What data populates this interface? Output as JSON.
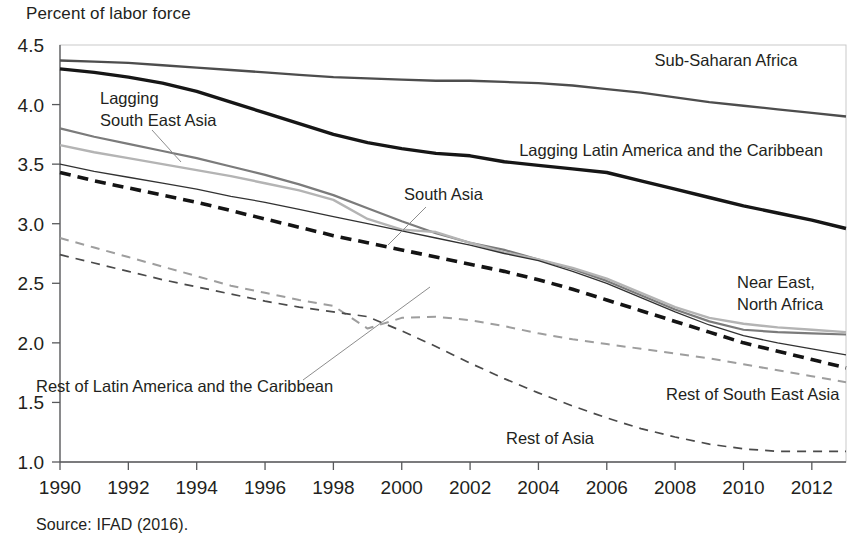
{
  "figure": {
    "y_axis_title": "Percent of labor force",
    "source_note": "Source: IFAD (2016)."
  },
  "chart_data": {
    "type": "line",
    "title": "",
    "subtitle": "",
    "xlabel": "",
    "ylabel": "Percent of labor force",
    "xlim": [
      1990,
      2013
    ],
    "ylim": [
      1.0,
      4.5
    ],
    "xticks": [
      1990,
      1992,
      1994,
      1996,
      1998,
      2000,
      2002,
      2004,
      2006,
      2008,
      2010,
      2012
    ],
    "yticks": [
      1.0,
      1.5,
      2.0,
      2.5,
      3.0,
      3.5,
      4.0,
      4.5
    ],
    "ytick_labels": [
      "1.0",
      "1.5",
      "2.0",
      "2.5",
      "3.0",
      "3.5",
      "4.0",
      "4.5"
    ],
    "xtick_labels": [
      "1990",
      "1992",
      "1994",
      "1996",
      "1998",
      "2000",
      "2002",
      "2004",
      "2006",
      "2008",
      "2010",
      "2012"
    ],
    "grid": false,
    "legend_position": "inline-annotations",
    "x": [
      1990,
      1991,
      1992,
      1993,
      1994,
      1995,
      1996,
      1997,
      1998,
      1999,
      2000,
      2001,
      2002,
      2003,
      2004,
      2005,
      2006,
      2007,
      2008,
      2009,
      2010,
      2011,
      2012,
      2013
    ],
    "series": [
      {
        "name": "Sub-Saharan Africa",
        "color": "#4d4d4d",
        "width": 2.3,
        "dash": "none",
        "values": [
          4.37,
          4.36,
          4.35,
          4.33,
          4.31,
          4.29,
          4.27,
          4.25,
          4.23,
          4.22,
          4.21,
          4.2,
          4.2,
          4.19,
          4.18,
          4.16,
          4.13,
          4.1,
          4.06,
          4.02,
          3.99,
          3.96,
          3.93,
          3.9
        ]
      },
      {
        "name": "Lagging Latin America and the Caribbean",
        "color": "#161616",
        "width": 3.4,
        "dash": "none",
        "values": [
          4.3,
          4.27,
          4.23,
          4.18,
          4.11,
          4.02,
          3.93,
          3.84,
          3.75,
          3.68,
          3.63,
          3.59,
          3.57,
          3.52,
          3.49,
          3.46,
          3.43,
          3.36,
          3.29,
          3.22,
          3.15,
          3.09,
          3.03,
          2.96
        ]
      },
      {
        "name": "Lagging South East Asia",
        "color": "#7b7b7b",
        "width": 2.2,
        "dash": "none",
        "values": [
          3.8,
          3.73,
          3.67,
          3.61,
          3.55,
          3.48,
          3.41,
          3.33,
          3.24,
          3.13,
          3.02,
          2.92,
          2.84,
          2.78,
          2.7,
          2.62,
          2.52,
          2.4,
          2.28,
          2.18,
          2.11,
          2.09,
          2.08,
          2.07
        ]
      },
      {
        "name": "South Asia",
        "color": "#b4b4b4",
        "width": 2.4,
        "dash": "none",
        "values": [
          3.66,
          3.6,
          3.55,
          3.5,
          3.45,
          3.4,
          3.34,
          3.28,
          3.2,
          3.04,
          2.95,
          2.93,
          2.84,
          2.76,
          2.7,
          2.63,
          2.54,
          2.42,
          2.3,
          2.21,
          2.16,
          2.13,
          2.11,
          2.09
        ]
      },
      {
        "name": "Near East, North Africa",
        "color": "#323232",
        "width": 1.3,
        "dash": "none",
        "values": [
          3.5,
          3.44,
          3.39,
          3.34,
          3.29,
          3.23,
          3.18,
          3.12,
          3.06,
          3.0,
          2.94,
          2.88,
          2.82,
          2.75,
          2.69,
          2.6,
          2.5,
          2.38,
          2.26,
          2.15,
          2.06,
          2.0,
          1.95,
          1.9
        ]
      },
      {
        "name": "Rest of South East Asia",
        "color": "#141414",
        "width": 3.6,
        "dash": "dashed-bold",
        "values": [
          3.43,
          3.36,
          3.3,
          3.24,
          3.18,
          3.11,
          3.04,
          2.97,
          2.9,
          2.84,
          2.78,
          2.72,
          2.66,
          2.6,
          2.53,
          2.45,
          2.36,
          2.27,
          2.18,
          2.09,
          2.0,
          1.93,
          1.86,
          1.79
        ]
      },
      {
        "name": "Rest of Latin America and the Caribbean",
        "color": "#9e9e9e",
        "width": 2.0,
        "dash": "dashed",
        "values": [
          2.88,
          2.8,
          2.72,
          2.64,
          2.56,
          2.48,
          2.42,
          2.36,
          2.31,
          2.12,
          2.21,
          2.22,
          2.19,
          2.14,
          2.08,
          2.03,
          1.99,
          1.95,
          1.91,
          1.87,
          1.82,
          1.77,
          1.72,
          1.67
        ]
      },
      {
        "name": "Rest of Asia",
        "color": "#4a4a4a",
        "width": 1.7,
        "dash": "dashed",
        "values": [
          2.74,
          2.67,
          2.6,
          2.53,
          2.47,
          2.41,
          2.35,
          2.3,
          2.26,
          2.22,
          2.1,
          1.97,
          1.83,
          1.7,
          1.58,
          1.47,
          1.37,
          1.28,
          1.21,
          1.15,
          1.11,
          1.09,
          1.09,
          1.09
        ]
      }
    ],
    "annotations": [
      {
        "text": "Sub-Saharan Africa",
        "x": 726,
        "y": 66,
        "anchor": "middle"
      },
      {
        "text": "Lagging Latin America and the Caribbean",
        "x": 671,
        "y": 156,
        "anchor": "middle"
      },
      {
        "text": "Lagging",
        "x": 100,
        "y": 104,
        "anchor": "start"
      },
      {
        "text": "South East Asia",
        "x": 100,
        "y": 126,
        "anchor": "start"
      },
      {
        "text": "South Asia",
        "x": 404,
        "y": 200,
        "anchor": "start"
      },
      {
        "text": "Near East,",
        "x": 737,
        "y": 288,
        "anchor": "start"
      },
      {
        "text": "North Africa",
        "x": 737,
        "y": 310,
        "anchor": "start"
      },
      {
        "text": "Rest of Latin America and the Caribbean",
        "x": 36,
        "y": 392,
        "anchor": "start"
      },
      {
        "text": "Rest of South East Asia",
        "x": 666,
        "y": 400,
        "anchor": "start"
      },
      {
        "text": "Rest of Asia",
        "x": 506,
        "y": 444,
        "anchor": "start"
      }
    ]
  }
}
